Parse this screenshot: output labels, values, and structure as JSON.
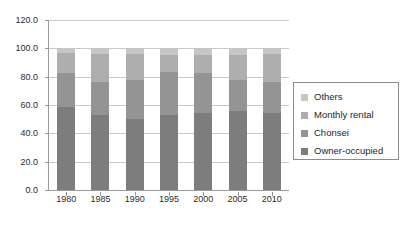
{
  "chart_data": {
    "type": "bar",
    "stacked": true,
    "title": "",
    "subtitle": "",
    "xlabel": "",
    "ylabel": "",
    "categories": [
      "1980",
      "1985",
      "1990",
      "1995",
      "2000",
      "2005",
      "2010"
    ],
    "series": [
      {
        "name": "Owner-occupied",
        "color": "#7d7d7d",
        "values": [
          58.6,
          53.0,
          49.9,
          53.3,
          54.2,
          55.6,
          54.2
        ]
      },
      {
        "name": "Chonsei",
        "color": "#949494",
        "values": [
          23.9,
          22.9,
          27.8,
          29.7,
          28.2,
          22.4,
          21.7
        ]
      },
      {
        "name": "Monthly rental",
        "color": "#aeaeae",
        "values": [
          14.5,
          20.0,
          18.0,
          12.6,
          12.7,
          17.2,
          20.1
        ]
      },
      {
        "name": "Others",
        "color": "#c6c6c6",
        "values": [
          3.0,
          4.1,
          4.3,
          4.4,
          4.9,
          4.8,
          4.0
        ]
      }
    ],
    "ylim": [
      0.0,
      120.0
    ],
    "yticks": [
      "0.0",
      "20.0",
      "40.0",
      "60.0",
      "80.0",
      "100.0",
      "120.0"
    ],
    "ytick_values": [
      0,
      20,
      40,
      60,
      80,
      100,
      120
    ],
    "grid": true,
    "legend_position": "right",
    "legend_entries": [
      "Others",
      "Monthly rental",
      "Chonsei",
      "Owner-occupied"
    ]
  },
  "axis": {
    "y_labels": [
      "120.0",
      "100.0",
      "80.0",
      "60.0",
      "40.0",
      "20.0",
      "0.0"
    ],
    "x_labels": [
      "1980",
      "1985",
      "1990",
      "1995",
      "2000",
      "2005",
      "2010"
    ]
  },
  "legend": {
    "items": [
      {
        "label": "Others",
        "color": "#c6c6c6"
      },
      {
        "label": "Monthly rental",
        "color": "#aeaeae"
      },
      {
        "label": "Chonsei",
        "color": "#949494"
      },
      {
        "label": "Owner-occupied",
        "color": "#7d7d7d"
      }
    ]
  },
  "colors": {
    "axis": "#9a9a9a",
    "grid": "#c9c9c9",
    "text": "#2b2b2b",
    "legend_border": "#8c8c8c",
    "background": "#ffffff"
  }
}
